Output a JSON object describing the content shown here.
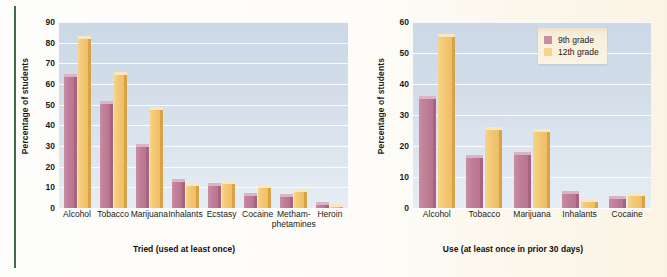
{
  "figure": {
    "ylabel": "Percentage of students",
    "legend": [
      {
        "key": "g9",
        "label": "9th grade",
        "color": "#c98ca3"
      },
      {
        "key": "g12",
        "label": "12th grade",
        "color": "#f6d48a"
      }
    ]
  },
  "chart_data": [
    {
      "type": "bar",
      "title": "",
      "xlabel": "Tried (used at least once)",
      "ylabel": "Percentage of students",
      "ylim": [
        0,
        90
      ],
      "yticks": [
        0,
        10,
        20,
        30,
        40,
        50,
        60,
        70,
        80,
        90
      ],
      "grid": true,
      "legend_position": "none",
      "categories": [
        "Alcohol",
        "Tobacco",
        "Marijuana",
        "Inhalants",
        "Ecstasy",
        "Cocaine",
        "Metham-\nphetamines",
        "Heroin"
      ],
      "series": [
        {
          "name": "9th grade",
          "color": "#c98ca3",
          "values": [
            65,
            52,
            31,
            14,
            12,
            7.5,
            7,
            3
          ]
        },
        {
          "name": "12th grade",
          "color": "#f6d48a",
          "values": [
            83,
            66,
            49,
            12,
            13,
            11,
            9,
            2
          ]
        }
      ]
    },
    {
      "type": "bar",
      "title": "",
      "xlabel": "Use (at least once in prior 30 days)",
      "ylabel": "Percentage of students",
      "ylim": [
        0,
        60
      ],
      "yticks": [
        0,
        10,
        20,
        30,
        40,
        50,
        60
      ],
      "grid": true,
      "legend_position": "top-right",
      "categories": [
        "Alcohol",
        "Tobacco",
        "Marijuana",
        "Inhalants",
        "Cocaine"
      ],
      "series": [
        {
          "name": "9th grade",
          "color": "#c98ca3",
          "values": [
            36,
            17,
            18,
            5.5,
            4
          ]
        },
        {
          "name": "12th grade",
          "color": "#f6d48a",
          "values": [
            56,
            26,
            25.5,
            3,
            5
          ]
        }
      ]
    }
  ]
}
